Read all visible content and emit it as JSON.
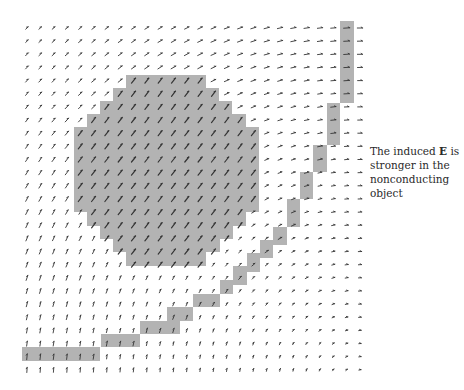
{
  "caption": {
    "line1_pre": "The induced ",
    "line1_bold": "E",
    "line1_post": " is",
    "line2": "stronger in the",
    "line3": "nonconducting",
    "line4": "object"
  },
  "colors": {
    "region_fill": "#b3b3b3",
    "arrow": "#333333",
    "background": "#ffffff"
  },
  "grid": {
    "x0": 27,
    "y0": 28,
    "dx": 13.32,
    "dy": 13.15,
    "cols": 26,
    "rows": 27
  },
  "field": {
    "center_x": 365,
    "center_y": 395,
    "description": "induced electric field vectors circulating around lower-right corner"
  },
  "regions": {
    "blob": [
      [
        126,
        75,
        206,
        88
      ],
      [
        113,
        88,
        219,
        101
      ],
      [
        100,
        101,
        232,
        114
      ],
      [
        87,
        114,
        246,
        127
      ],
      [
        74,
        127,
        259,
        212
      ],
      [
        87,
        212,
        246,
        226
      ],
      [
        100,
        226,
        233,
        239
      ],
      [
        113,
        239,
        220,
        252
      ],
      [
        126,
        252,
        206,
        266
      ]
    ],
    "strip": [
      [
        340,
        21,
        354,
        103
      ],
      [
        327,
        103,
        340,
        145
      ],
      [
        313,
        145,
        327,
        172
      ],
      [
        300,
        172,
        313,
        199
      ],
      [
        287,
        199,
        300,
        227
      ],
      [
        273,
        227,
        287,
        245
      ],
      [
        260,
        240,
        273,
        258
      ],
      [
        247,
        253,
        260,
        272
      ],
      [
        233,
        266,
        247,
        285
      ],
      [
        220,
        280,
        233,
        294
      ],
      [
        193,
        294,
        220,
        307
      ],
      [
        167,
        307,
        193,
        321
      ],
      [
        140,
        321,
        180,
        334
      ],
      [
        101,
        334,
        140,
        347
      ],
      [
        22,
        347,
        100,
        361
      ]
    ]
  }
}
